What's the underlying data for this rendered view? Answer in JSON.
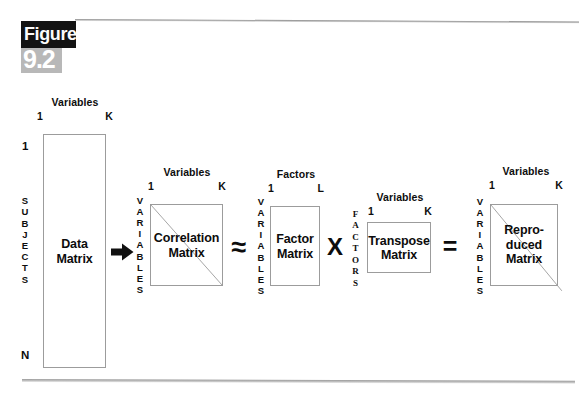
{
  "figure": {
    "word_label": "Figure",
    "number_label": "9.2",
    "caption": ""
  },
  "diagram": {
    "type": "factor-analysis-matrix-equation",
    "blocks": [
      {
        "id": "data-matrix",
        "label": "Data\nMatrix",
        "col_header_title": "Variables",
        "col_header_start": "1",
        "col_header_end": "K",
        "row_label_letters": [
          "S",
          "U",
          "B",
          "J",
          "E",
          "C",
          "T",
          "S"
        ],
        "row_start": "1",
        "row_end": "N",
        "diagonal": false
      },
      {
        "id": "correlation-matrix",
        "label": "Correlation\nMatrix",
        "col_header_title": "Variables",
        "col_header_start": "1",
        "col_header_end": "K",
        "row_label_letters": [
          "V",
          "A",
          "R",
          "I",
          "A",
          "B",
          "L",
          "E",
          "S"
        ],
        "diagonal": true
      },
      {
        "id": "factor-matrix",
        "label": "Factor\nMatrix",
        "col_header_title": "Factors",
        "col_header_start": "1",
        "col_header_end": "L",
        "row_label_letters": [
          "V",
          "A",
          "R",
          "I",
          "A",
          "B",
          "L",
          "E",
          "S"
        ],
        "diagonal": false
      },
      {
        "id": "transpose-matrix",
        "label": "Transpose\nMatrix",
        "col_header_title": "Variables",
        "col_header_start": "1",
        "col_header_end": "K",
        "row_label_letters": [
          "F",
          "A",
          "C",
          "T",
          "O",
          "R",
          "S"
        ],
        "diagonal": false
      },
      {
        "id": "reproduced-matrix",
        "label": "Repro-\nduced\nMatrix",
        "col_header_title": "Variables",
        "col_header_start": "1",
        "col_header_end": "K",
        "row_label_letters": [
          "V",
          "A",
          "R",
          "I",
          "A",
          "B",
          "L",
          "E",
          "S"
        ],
        "diagonal": true
      }
    ],
    "operators": {
      "arrow": "➜",
      "approx": "≈",
      "times": "X",
      "equals": "="
    }
  },
  "colors": {
    "ink": "#0d0d0d",
    "box_stroke": "#9c9c9c",
    "label_block_dark": "#131313",
    "label_block_gray": "#b8b8b8",
    "page_bg": "#ffffff"
  }
}
